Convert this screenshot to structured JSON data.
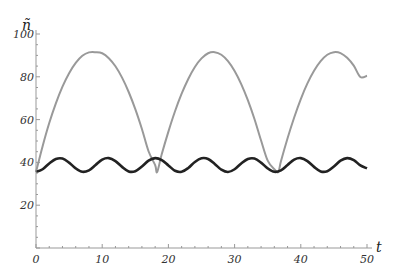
{
  "chart_data": {
    "type": "line",
    "title": "",
    "xlabel": "t",
    "ylabel": "ñ",
    "xlim": [
      0,
      50
    ],
    "ylim": [
      0,
      100
    ],
    "grid": false,
    "legend": null,
    "x_ticks": [
      0,
      10,
      20,
      30,
      40,
      50
    ],
    "y_ticks": [
      20,
      40,
      60,
      80,
      100
    ],
    "series": [
      {
        "name": "gray",
        "color": "#999999",
        "x": [
          0,
          1,
          2,
          3,
          4,
          5,
          6,
          7,
          8,
          9,
          10,
          11,
          12,
          13,
          14,
          15,
          16,
          17,
          18,
          18.3,
          19,
          20,
          21,
          22,
          23,
          24,
          25,
          26,
          27,
          28,
          29,
          30,
          31,
          32,
          33,
          34,
          35,
          36,
          36.6,
          37,
          38,
          39,
          40,
          41,
          42,
          43,
          44,
          45,
          46,
          47,
          48,
          49,
          50
        ],
        "values": [
          35.5,
          47.6,
          58.4,
          67.6,
          75.4,
          81.7,
          86.5,
          89.8,
          91.4,
          91.5,
          91.0,
          88.7,
          84.9,
          79.6,
          72.9,
          64.9,
          55.6,
          45.2,
          38.7,
          35.5,
          43.9,
          54.4,
          63.9,
          72.1,
          79.0,
          84.6,
          88.6,
          91.0,
          91.5,
          90.3,
          87.3,
          82.7,
          76.6,
          69.1,
          60.3,
          50.2,
          40.8,
          36.8,
          35.5,
          40.5,
          51.3,
          61.0,
          69.6,
          76.9,
          82.8,
          87.3,
          90.3,
          91.5,
          91.1,
          88.9,
          85.2,
          79.9,
          80.5
        ]
      },
      {
        "name": "black",
        "color": "#222222",
        "x": [
          0,
          1,
          2,
          3,
          4,
          5,
          6,
          7,
          8,
          9,
          10,
          11,
          12,
          13,
          14,
          15,
          16,
          17,
          18,
          19,
          20,
          21,
          22,
          23,
          24,
          25,
          26,
          27,
          28,
          29,
          30,
          31,
          32,
          33,
          34,
          35,
          36,
          37,
          38,
          39,
          40,
          41,
          42,
          43,
          44,
          45,
          46,
          47,
          48,
          49,
          50
        ],
        "values": [
          35.5,
          36.8,
          39.5,
          41.6,
          41.8,
          39.9,
          37.2,
          35.6,
          36.3,
          38.8,
          41.3,
          42.0,
          40.6,
          37.9,
          35.8,
          35.9,
          38.1,
          40.8,
          42.0,
          41.1,
          38.6,
          36.1,
          35.6,
          37.4,
          40.2,
          41.9,
          41.6,
          39.3,
          36.6,
          35.5,
          36.8,
          39.5,
          41.6,
          41.8,
          39.9,
          37.2,
          35.6,
          36.3,
          38.8,
          41.3,
          42.0,
          40.6,
          37.9,
          35.8,
          35.9,
          38.1,
          40.8,
          42.0,
          41.1,
          38.6,
          37.2
        ]
      }
    ]
  }
}
